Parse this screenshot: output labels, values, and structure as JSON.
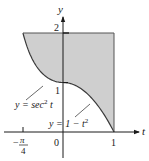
{
  "chart_data": {
    "type": "area",
    "title": "",
    "xlabel": "t",
    "ylabel": "y",
    "xlim": [
      -0.9,
      1.5
    ],
    "ylim": [
      -0.55,
      2.5
    ],
    "x_ticks": [
      {
        "value": -0.7854,
        "label_num": "π",
        "label_den": "4",
        "label_sign": "−"
      },
      {
        "value": 0,
        "label": "0"
      },
      {
        "value": 1,
        "label": "1"
      }
    ],
    "y_ticks": [
      {
        "value": 1,
        "label": "1"
      },
      {
        "value": 2,
        "label": "2"
      }
    ],
    "curves": [
      {
        "name": "y = sec² t",
        "domain": [
          -0.7854,
          0
        ]
      },
      {
        "name": "y = 1 − t²",
        "domain": [
          0,
          1
        ]
      }
    ],
    "region": {
      "description": "Shaded region bounded above by y = 2, left by y = sec² t, below by y = 1 − t², right by t = 1",
      "fill": "#cfcfcf",
      "stroke": "#3a3a3a"
    },
    "grid": false,
    "legend": null
  },
  "labels": {
    "y_axis": "y",
    "t_axis": "t",
    "y_two": "2",
    "y_one": "1",
    "origin": "0",
    "t_one": "1",
    "neg_sign": "−",
    "pi": "π",
    "four": "4",
    "sec_curve_y": "y = sec",
    "sec_curve_exp": "2",
    "sec_curve_t": " t",
    "parab_curve": "y = 1 − t",
    "parab_exp": "2"
  }
}
